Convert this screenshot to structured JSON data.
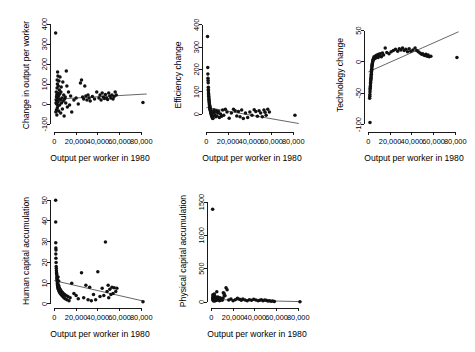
{
  "figure": {
    "background": "#ffffff",
    "point_color": "#111111",
    "line_color": "#4a4a4a",
    "axis_color": "#000000",
    "layout": "2 rows x 3 columns, last cell empty",
    "shared_xlabel": "Output per worker in 1980",
    "shared_xticklabels": [
      "0",
      "20,000",
      "40,000",
      "60,000",
      "80,000"
    ],
    "shared_xticks": [
      0,
      20000,
      40000,
      60000,
      80000
    ]
  },
  "chart_data": [
    {
      "id": "panel-change-in-output",
      "type": "scatter",
      "title": "",
      "xlabel": "Output per worker in 1980",
      "ylabel": "Change in output per worker",
      "xlim": [
        -4000,
        88000
      ],
      "ylim": [
        -140,
        430
      ],
      "xticks": [
        0,
        20000,
        40000,
        60000,
        80000
      ],
      "xticklabels": [
        "0",
        "20,000",
        "40,000",
        "60,000",
        "80,000"
      ],
      "yticks": [
        -100,
        0,
        100,
        200,
        300,
        400
      ],
      "yticklabels": [
        "-100",
        "0",
        "100",
        "200",
        "300",
        "400"
      ],
      "grid": false,
      "legend": "none",
      "fit_line": {
        "x": [
          0,
          85000
        ],
        "y": [
          24,
          50
        ]
      },
      "x": [
        1200,
        1400,
        1500,
        1700,
        1800,
        1900,
        2000,
        2100,
        2200,
        2300,
        2400,
        2500,
        2600,
        2700,
        2800,
        2900,
        3000,
        3100,
        3200,
        3300,
        3400,
        3600,
        3800,
        4000,
        4200,
        4400,
        4600,
        4800,
        5000,
        5200,
        5500,
        5800,
        6000,
        6300,
        6600,
        7000,
        7400,
        7800,
        8200,
        8600,
        9000,
        9500,
        10000,
        10500,
        11000,
        11500,
        12000,
        13000,
        14000,
        15000,
        16000,
        18000,
        20000,
        22000,
        24000,
        25000,
        26000,
        27000,
        28000,
        29000,
        30000,
        31000,
        32000,
        33000,
        35000,
        37000,
        39000,
        41000,
        42000,
        43000,
        44000,
        45000,
        46000,
        47000,
        48000,
        49000,
        50000,
        51000,
        52000,
        53000,
        54000,
        55000,
        56000,
        57000,
        81500
      ],
      "y": [
        355,
        -40,
        5,
        20,
        60,
        -30,
        35,
        0,
        45,
        -55,
        15,
        80,
        120,
        -20,
        100,
        30,
        160,
        55,
        -10,
        140,
        10,
        90,
        40,
        -35,
        115,
        25,
        70,
        -5,
        50,
        135,
        20,
        -45,
        60,
        85,
        5,
        30,
        -25,
        110,
        15,
        45,
        -60,
        25,
        35,
        5,
        165,
        90,
        -15,
        60,
        -5,
        40,
        -40,
        20,
        30,
        0,
        105,
        120,
        35,
        25,
        90,
        40,
        20,
        45,
        30,
        15,
        38,
        25,
        60,
        30,
        45,
        20,
        55,
        35,
        28,
        48,
        30,
        22,
        55,
        40,
        30,
        45,
        25,
        38,
        60,
        45,
        8
      ]
    },
    {
      "id": "panel-efficiency-change",
      "type": "scatter",
      "title": "",
      "xlabel": "Output per worker in 1980",
      "ylabel": "Efficiency change",
      "xlim": [
        -4000,
        88000
      ],
      "ylim": [
        -80,
        430
      ],
      "xticks": [
        0,
        20000,
        40000,
        60000,
        80000
      ],
      "xticklabels": [
        "0",
        "20,000",
        "40,000",
        "60,000",
        "80,000"
      ],
      "yticks": [
        0,
        100,
        200,
        300,
        400
      ],
      "yticklabels": [
        "0",
        "100",
        "200",
        "300",
        "400"
      ],
      "grid": false,
      "legend": "none",
      "fit_line": {
        "x": [
          0,
          85000
        ],
        "y": [
          30,
          -42
        ]
      },
      "x": [
        1100,
        1300,
        1400,
        1500,
        1600,
        1700,
        1800,
        1850,
        1900,
        2000,
        2050,
        2100,
        2200,
        2300,
        2400,
        2500,
        2600,
        2700,
        2800,
        2900,
        3000,
        3100,
        3200,
        3300,
        3400,
        3500,
        3600,
        3700,
        3800,
        3900,
        4000,
        4100,
        4200,
        4400,
        4600,
        4800,
        5000,
        5200,
        5400,
        5600,
        5800,
        6000,
        6300,
        6600,
        7000,
        7400,
        7800,
        8200,
        8700,
        9200,
        9800,
        10500,
        11200,
        12000,
        13000,
        14000,
        15000,
        16000,
        17500,
        19000,
        21000,
        23000,
        25000,
        26500,
        28000,
        29500,
        31000,
        32500,
        34000,
        36000,
        38000,
        40000,
        42000,
        44000,
        45500,
        47000,
        48500,
        50000,
        51500,
        53000,
        54000,
        55000,
        56500,
        58000,
        81500
      ],
      "y": [
        347,
        208,
        180,
        160,
        150,
        140,
        120,
        110,
        105,
        95,
        90,
        85,
        80,
        72,
        66,
        60,
        55,
        50,
        45,
        42,
        38,
        35,
        32,
        28,
        25,
        22,
        20,
        18,
        15,
        12,
        10,
        8,
        5,
        2,
        0,
        -5,
        -8,
        -10,
        -12,
        -15,
        -18,
        -20,
        5,
        12,
        18,
        8,
        -5,
        10,
        -12,
        15,
        -8,
        5,
        12,
        -15,
        0,
        -10,
        18,
        -5,
        22,
        10,
        -18,
        5,
        22,
        15,
        -8,
        12,
        -12,
        18,
        -20,
        5,
        -15,
        10,
        -5,
        20,
        12,
        -10,
        15,
        5,
        -12,
        18,
        8,
        -5,
        22,
        10,
        -5
      ]
    },
    {
      "id": "panel-technology-change",
      "type": "scatter",
      "title": "",
      "xlabel": "Output per worker in 1980",
      "ylabel": "Technology change",
      "xlim": [
        -4000,
        88000
      ],
      "ylim": [
        -112,
        70
      ],
      "xticks": [
        0,
        20000,
        40000,
        60000,
        80000
      ],
      "xticklabels": [
        "0",
        "20,000",
        "40,000",
        "60,000",
        "80,000"
      ],
      "yticks": [
        -100,
        -50,
        0,
        50
      ],
      "yticklabels": [
        "-100",
        "-50",
        "0",
        "50"
      ],
      "grid": false,
      "legend": "none",
      "fit_line": {
        "x": [
          0,
          83000
        ],
        "y": [
          -16,
          48
        ]
      },
      "x": [
        1200,
        1300,
        1400,
        1500,
        1600,
        1700,
        1800,
        1900,
        2000,
        2100,
        2200,
        2300,
        2400,
        2500,
        2600,
        2700,
        2800,
        2900,
        3000,
        3100,
        3200,
        3300,
        3400,
        3500,
        3600,
        3800,
        4000,
        4200,
        4400,
        4600,
        4800,
        5000,
        5300,
        5600,
        6000,
        6400,
        6800,
        7200,
        7600,
        8000,
        8500,
        9000,
        9500,
        10000,
        11000,
        12000,
        13000,
        14000,
        15500,
        17000,
        19000,
        21000,
        23000,
        25000,
        27000,
        28500,
        30000,
        31500,
        33000,
        34500,
        36000,
        37500,
        39000,
        41000,
        43000,
        44500,
        46000,
        47500,
        49000,
        50000,
        51000,
        52000,
        53000,
        54000,
        55000,
        56000,
        57500,
        81500,
        1500
      ],
      "y": [
        -58,
        -55,
        -52,
        -48,
        -45,
        -42,
        -40,
        -38,
        -35,
        -33,
        -30,
        -28,
        -26,
        -24,
        -22,
        -20,
        -18,
        -16,
        -14,
        -12,
        -10,
        -8,
        -6,
        -5,
        -3,
        -2,
        0,
        2,
        3,
        5,
        4,
        6,
        8,
        5,
        7,
        9,
        6,
        10,
        8,
        11,
        9,
        7,
        12,
        10,
        13,
        8,
        14,
        11,
        22,
        15,
        13,
        16,
        18,
        20,
        17,
        21,
        19,
        22,
        18,
        20,
        16,
        21,
        17,
        19,
        22,
        18,
        16,
        14,
        12,
        13,
        11,
        10,
        12,
        9,
        11,
        8,
        9,
        7,
        -97
      ]
    },
    {
      "id": "panel-human-capital",
      "type": "scatter",
      "title": "",
      "xlabel": "Output per worker in 1980",
      "ylabel": "Human capital accumulation",
      "xlim": [
        -4000,
        88000
      ],
      "ylim": [
        -2,
        53
      ],
      "xticks": [
        0,
        20000,
        40000,
        60000,
        80000
      ],
      "xticklabels": [
        "0",
        "20,000",
        "40,000",
        "60,000",
        "80,000"
      ],
      "yticks": [
        0,
        10,
        20,
        30,
        40,
        50
      ],
      "yticklabels": [
        "0",
        "10",
        "20",
        "30",
        "40",
        "50"
      ],
      "grid": false,
      "legend": "none",
      "fit_line": {
        "x": [
          0,
          83000
        ],
        "y": [
          11.2,
          1.2
        ]
      },
      "x": [
        1200,
        1250,
        1300,
        1400,
        1500,
        1600,
        1700,
        1800,
        1900,
        2000,
        2100,
        2200,
        2300,
        2400,
        2500,
        2600,
        2700,
        2800,
        2900,
        3000,
        3100,
        3200,
        3300,
        3500,
        3700,
        3900,
        4100,
        4300,
        4500,
        4700,
        4900,
        5200,
        5500,
        5800,
        6200,
        6600,
        7000,
        7400,
        7800,
        8300,
        8800,
        9400,
        10000,
        10800,
        11600,
        12500,
        13500,
        14500,
        16000,
        18000,
        20000,
        22000,
        25000,
        27000,
        29000,
        31000,
        32500,
        34000,
        36000,
        38000,
        40000,
        42000,
        44000,
        45500,
        47000,
        48500,
        49500,
        50000,
        51000,
        52000,
        53000,
        54000,
        55000,
        56500,
        57500,
        81500,
        1350,
        1450,
        3400,
        4000
      ],
      "y": [
        50,
        39.5,
        29.5,
        27,
        26,
        20,
        18,
        17,
        16,
        15,
        14.5,
        14,
        13,
        12.5,
        12,
        11.5,
        11,
        10.5,
        10,
        9.5,
        9,
        8.5,
        8,
        7.5,
        7,
        9,
        6.5,
        8,
        6,
        7.5,
        5.5,
        7,
        5,
        6.5,
        4.5,
        6,
        4,
        5.5,
        3.5,
        5,
        3,
        4.5,
        2.5,
        4,
        2,
        3.5,
        1.5,
        3,
        10,
        5,
        4,
        2.5,
        15,
        3,
        9,
        2,
        8,
        1.5,
        4.5,
        2,
        15.5,
        3.5,
        7.5,
        4,
        29.8,
        6,
        9,
        3,
        7,
        4.5,
        8,
        5,
        7.8,
        6,
        7.5,
        1,
        24,
        22,
        13,
        11
      ]
    },
    {
      "id": "panel-physical-capital",
      "type": "scatter",
      "title": "",
      "xlabel": "Output per worker in 1980",
      "ylabel": "Physical capital accumulation",
      "xlim": [
        -4000,
        88000
      ],
      "ylim": [
        -90,
        1620
      ],
      "xticks": [
        0,
        20000,
        40000,
        60000,
        80000
      ],
      "xticklabels": [
        "0",
        "20,000",
        "40,000",
        "60,000",
        "80,000"
      ],
      "yticks": [
        0,
        500,
        1000,
        1500
      ],
      "yticklabels": [
        "0",
        "500",
        "1000",
        "1500"
      ],
      "grid": false,
      "legend": "none",
      "fit_line": {
        "x": [
          0,
          83000
        ],
        "y": [
          38,
          5
        ]
      },
      "x": [
        1200,
        1300,
        1400,
        1500,
        1600,
        1700,
        1800,
        1900,
        2000,
        2100,
        2200,
        2300,
        2400,
        2500,
        2600,
        2700,
        2800,
        2900,
        3000,
        3200,
        3400,
        3600,
        3800,
        4000,
        4300,
        4600,
        4900,
        5200,
        5600,
        6000,
        6500,
        7000,
        7500,
        8000,
        8600,
        9200,
        10000,
        10800,
        11600,
        12500,
        13500,
        14500,
        16000,
        18000,
        20000,
        22000,
        24000,
        26000,
        27500,
        29000,
        31000,
        33000,
        35000,
        37000,
        39000,
        41000,
        43000,
        44500,
        46000,
        47500,
        49000,
        50500,
        52000,
        53500,
        55000,
        56500,
        58000,
        81500,
        1450,
        2750,
        5000,
        11000,
        12000
      ],
      "y": [
        1390,
        60,
        45,
        90,
        30,
        70,
        20,
        55,
        40,
        85,
        25,
        65,
        35,
        75,
        15,
        50,
        95,
        30,
        60,
        40,
        80,
        20,
        55,
        35,
        70,
        25,
        60,
        45,
        30,
        75,
        40,
        55,
        20,
        65,
        35,
        50,
        25,
        60,
        130,
        95,
        215,
        185,
        30,
        45,
        20,
        35,
        55,
        40,
        25,
        45,
        30,
        20,
        35,
        25,
        40,
        30,
        20,
        25,
        35,
        20,
        30,
        25,
        15,
        20,
        10,
        15,
        8,
        5,
        110,
        120,
        155,
        140,
        100
      ]
    }
  ]
}
